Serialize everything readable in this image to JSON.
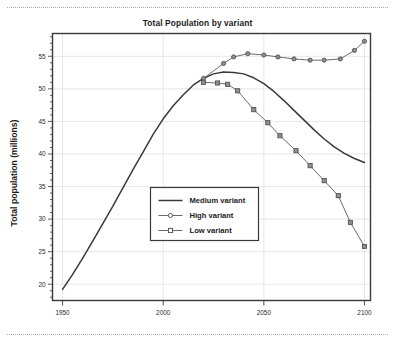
{
  "figure": {
    "title": "Total Population by variant",
    "ylabel": "Total population (millions)",
    "xlabel": "",
    "background": "#ffffff",
    "plot_border_color": "#3a3a3a",
    "grid_color": "#d9dce6"
  },
  "axes": {
    "x_ticks": [
      "1950",
      "2000",
      "2050",
      "2100"
    ],
    "y_ticks": [
      "20",
      "25",
      "30",
      "35",
      "40",
      "45",
      "50",
      "55"
    ]
  },
  "legend": {
    "items": [
      {
        "label": "Medium variant",
        "marker": "none",
        "color": "#3a3a3a"
      },
      {
        "label": "High variant",
        "marker": "circle",
        "color": "#6b6b6b"
      },
      {
        "label": "Low variant",
        "marker": "square",
        "color": "#6b6b6b"
      }
    ]
  },
  "chart_data": {
    "type": "line",
    "title": "Total Population by variant",
    "xlabel": "",
    "ylabel": "Total population (millions)",
    "xlim": [
      1945,
      2103
    ],
    "ylim": [
      17.5,
      58.5
    ],
    "xticks": [
      1950,
      2000,
      2050,
      2100
    ],
    "yticks": [
      20,
      25,
      30,
      35,
      40,
      45,
      50,
      55
    ],
    "grid": true,
    "legend_position": "center",
    "series": [
      {
        "name": "Medium variant",
        "marker": "none",
        "color": "#3a3a3a",
        "x": [
          1950,
          1955,
          1960,
          1965,
          1970,
          1975,
          1980,
          1985,
          1990,
          1995,
          2000,
          2005,
          2010,
          2015,
          2020,
          2025,
          2030,
          2035,
          2040,
          2045,
          2050,
          2055,
          2060,
          2065,
          2070,
          2075,
          2080,
          2085,
          2090,
          2095,
          2100
        ],
        "y": [
          19.2,
          21.5,
          24.0,
          26.6,
          29.3,
          32.0,
          34.8,
          37.6,
          40.3,
          43.0,
          45.4,
          47.4,
          49.1,
          50.6,
          51.6,
          52.3,
          52.6,
          52.5,
          52.3,
          51.7,
          50.8,
          49.6,
          48.2,
          46.7,
          45.2,
          43.7,
          42.3,
          41.1,
          40.1,
          39.3,
          38.7
        ]
      },
      {
        "name": "High variant",
        "marker": "circle",
        "color": "#6b6b6b",
        "x": [
          2020,
          2030,
          2035,
          2042,
          2050,
          2057,
          2065,
          2073,
          2080,
          2088,
          2095,
          2100
        ],
        "y": [
          51.6,
          53.9,
          54.9,
          55.4,
          55.2,
          54.9,
          54.6,
          54.4,
          54.4,
          54.6,
          55.9,
          57.3
        ]
      },
      {
        "name": "Low variant",
        "marker": "square",
        "color": "#6b6b6b",
        "x": [
          2020,
          2027,
          2032,
          2037,
          2045,
          2052,
          2058,
          2066,
          2073,
          2080,
          2087,
          2093,
          2100
        ],
        "y": [
          51.0,
          50.9,
          50.7,
          49.7,
          46.8,
          44.8,
          42.8,
          40.5,
          38.2,
          35.9,
          33.6,
          29.5,
          25.8
        ]
      }
    ]
  }
}
